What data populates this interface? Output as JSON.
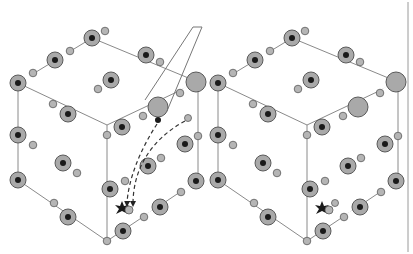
{
  "figure": {
    "colors": {
      "background": "#ffffff",
      "edge": "#8a8a8a",
      "atom_fill": "#a9a9a9",
      "atom_stroke": "#5a5a5a",
      "nucleus": "#1a1a1a",
      "hydrogen_fill": "#b5b5b5",
      "divider": "#9a9a9a",
      "path": "#333333"
    },
    "panels": [
      {
        "name": "left-cube",
        "offset_x": 0,
        "has_paths": true,
        "has_callout": true
      },
      {
        "name": "right-cube",
        "offset_x": 200,
        "has_paths": false,
        "has_callout": false
      }
    ],
    "icons": [
      "defect-star-icon",
      "water-molecule-icon",
      "arrow-icon"
    ]
  }
}
